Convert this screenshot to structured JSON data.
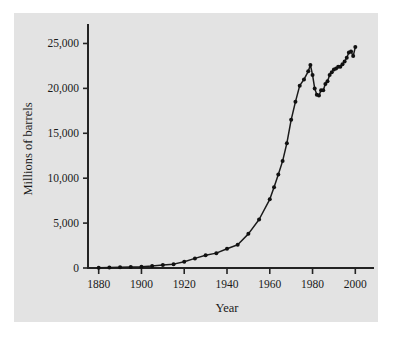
{
  "figure": {
    "background_color": "#ffffff",
    "panel_color": "#e3e3e3",
    "ink_color": "#1b1b1b"
  },
  "chart_data": {
    "type": "line",
    "title": "",
    "xlabel": "Year",
    "ylabel": "Millions of barrels",
    "xlim": [
      1875,
      2005
    ],
    "ylim": [
      0,
      26500
    ],
    "grid": false,
    "legend": null,
    "markers": "filled-circle",
    "xticks": [
      1880,
      1900,
      1920,
      1940,
      1960,
      1980,
      2000
    ],
    "xtick_labels": [
      "1880",
      "1900",
      "1920",
      "1940",
      "1960",
      "1980",
      "2000"
    ],
    "yticks": [
      0,
      5000,
      10000,
      15000,
      20000,
      25000
    ],
    "ytick_labels": [
      "0",
      "5,000",
      "10,000",
      "15,000",
      "20,000",
      "25,000"
    ],
    "series": [
      {
        "name": "World crude oil production",
        "x": [
          1880,
          1885,
          1890,
          1895,
          1900,
          1905,
          1910,
          1915,
          1920,
          1925,
          1930,
          1935,
          1940,
          1945,
          1950,
          1955,
          1960,
          1962,
          1964,
          1966,
          1968,
          1970,
          1972,
          1974,
          1976,
          1978,
          1979,
          1980,
          1981,
          1982,
          1983,
          1984,
          1985,
          1986,
          1987,
          1988,
          1989,
          1990,
          1991,
          1992,
          1993,
          1994,
          1995,
          1996,
          1997,
          1998,
          1999,
          2000
        ],
        "y": [
          30,
          60,
          80,
          120,
          150,
          215,
          330,
          430,
          690,
          1070,
          1410,
          1655,
          2150,
          2595,
          3800,
          5400,
          7650,
          9000,
          10400,
          11900,
          13900,
          16500,
          18500,
          20300,
          21000,
          21900,
          22600,
          21500,
          20000,
          19300,
          19200,
          19800,
          19800,
          20500,
          20800,
          21500,
          21800,
          22100,
          22200,
          22400,
          22400,
          22700,
          23000,
          23400,
          24000,
          24100,
          23600,
          24600
        ]
      }
    ]
  }
}
